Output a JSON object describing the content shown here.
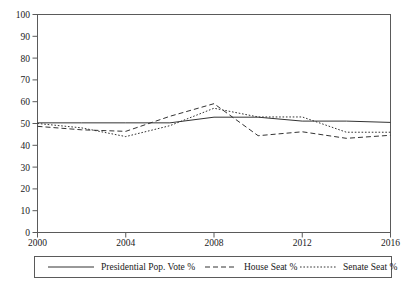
{
  "chart_data": {
    "type": "line",
    "title": "",
    "subtitle": "",
    "xlabel": "",
    "ylabel": "",
    "xlim": [
      2000,
      2016
    ],
    "ylim": [
      0,
      100
    ],
    "grid": false,
    "legend_position": "bottom",
    "x": [
      2000,
      2002,
      2004,
      2006,
      2008,
      2010,
      2012,
      2014,
      2016
    ],
    "xticks": [
      "2000",
      "2004",
      "2008",
      "2012",
      "2016"
    ],
    "xtick_values": [
      2000,
      2004,
      2008,
      2012,
      2016
    ],
    "yticks": [
      "0",
      "10",
      "20",
      "30",
      "40",
      "50",
      "60",
      "70",
      "80",
      "90",
      "100"
    ],
    "ytick_values": [
      0,
      10,
      20,
      30,
      40,
      50,
      60,
      70,
      80,
      90,
      100
    ],
    "series": [
      {
        "name": "Presidential Pop. Vote %",
        "style": "solid",
        "color": "#333333",
        "values": [
          50.3,
          50.3,
          50.3,
          50.3,
          52.9,
          52.9,
          51.1,
          51.1,
          50.5
        ]
      },
      {
        "name": "House Seat %",
        "style": "dashed",
        "color": "#333333",
        "values": [
          48.7,
          47.1,
          46.4,
          53.3,
          59.1,
          44.4,
          46.2,
          43.2,
          44.6
        ]
      },
      {
        "name": "Senate Seat %",
        "style": "dotted",
        "color": "#333333",
        "values": [
          50.0,
          48.0,
          44.0,
          49.0,
          57.0,
          53.0,
          53.0,
          46.0,
          46.0
        ]
      }
    ]
  },
  "legend": {
    "items": [
      {
        "label": "Presidential Pop. Vote %"
      },
      {
        "label": "House Seat %"
      },
      {
        "label": "Senate Seat %"
      }
    ]
  }
}
